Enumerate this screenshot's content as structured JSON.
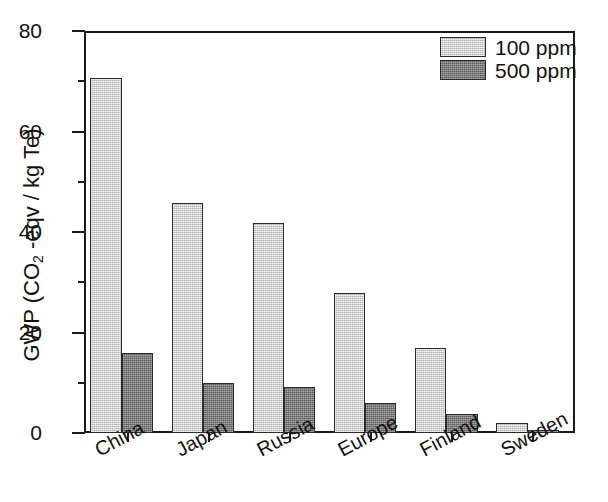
{
  "chart_data": {
    "type": "bar",
    "title": "",
    "xlabel": "",
    "ylabel": "GWP (CO2 -eqv / kg Te)",
    "ylabel_parts": {
      "prefix": "GWP (CO",
      "sub": "2",
      "suffix": " -eqv / kg Te)"
    },
    "categories": [
      "China",
      "Japan",
      "Russia",
      "Europe",
      "Finland",
      "Sweden"
    ],
    "series": [
      {
        "name": "100 ppm",
        "color": "#c9c9c9",
        "values": [
          71,
          46,
          42,
          28,
          17,
          2
        ]
      },
      {
        "name": "500 ppm",
        "color": "#767676",
        "values": [
          16,
          10,
          9.3,
          6,
          3.8,
          0.7
        ]
      }
    ],
    "ylim": [
      0,
      80
    ],
    "yticks": [
      0,
      20,
      40,
      60,
      80
    ],
    "ytick_labels": [
      "0",
      "20",
      "40",
      "60",
      "80"
    ],
    "yminor_ticks": [
      10,
      30,
      50,
      70
    ],
    "grid": false,
    "legend_position": "top-right",
    "frame": "box"
  },
  "legend": {
    "entries": [
      {
        "label": "100 ppm"
      },
      {
        "label": "500 ppm"
      }
    ]
  },
  "axis": {
    "y_title_prefix": "GWP (CO",
    "y_title_sub": "2",
    "y_title_suffix": " -eqv / kg Te)"
  }
}
